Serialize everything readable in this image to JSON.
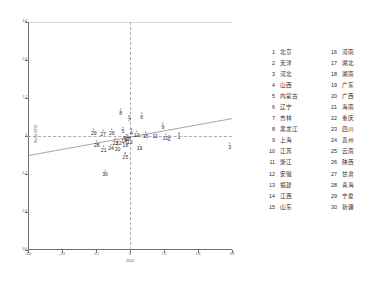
{
  "chart_data": {
    "type": "scatter",
    "title": "",
    "xlabel": "2010",
    "ylabel": "Resid 2010",
    "xlim": [
      -3.6,
      3.6
    ],
    "ylim": [
      -3.6,
      3.6
    ],
    "xticks": [
      "-3.6",
      "-2.4",
      "-1.2",
      "0",
      "1.2",
      "2.4",
      "3.6"
    ],
    "yticks": [
      "-3.6",
      "-2.4",
      "-1.2",
      "0",
      "1.2",
      "2.4",
      "3.6"
    ],
    "grid": false,
    "legend_position": "right",
    "reference_lines": {
      "vertical_x": 0,
      "horizontal_y": 0,
      "style": "dashed"
    },
    "fit_line": {
      "style": "solid",
      "x0": -3.6,
      "y0": -0.62,
      "x1": 3.6,
      "y1": 0.55
    },
    "point_label_field": "id",
    "points": [
      {
        "id": 1,
        "label": "1",
        "x": 1.73,
        "y": 0.08
      },
      {
        "id": 2,
        "label": "2",
        "x": 1.38,
        "y": 0.01
      },
      {
        "id": 3,
        "label": "3",
        "x": 3.52,
        "y": -0.22
      },
      {
        "id": 4,
        "label": "4",
        "x": 0.05,
        "y": 0.22
      },
      {
        "id": 5,
        "label": "5",
        "x": -0.25,
        "y": 0.26
      },
      {
        "id": 6,
        "label": "6",
        "x": 0.41,
        "y": 0.72
      },
      {
        "id": 7,
        "label": "7",
        "x": -0.03,
        "y": 0.63
      },
      {
        "id": 8,
        "label": "8",
        "x": -0.33,
        "y": 0.85
      },
      {
        "id": 9,
        "label": "9",
        "x": 1.16,
        "y": 0.4
      },
      {
        "id": 10,
        "label": "10",
        "x": 1.26,
        "y": 0.06
      },
      {
        "id": 11,
        "label": "11",
        "x": 0.89,
        "y": 0.1
      },
      {
        "id": 12,
        "label": "12",
        "x": 0.23,
        "y": 0.15
      },
      {
        "id": 13,
        "label": "13",
        "x": -0.01,
        "y": -0.09
      },
      {
        "id": 14,
        "label": "14",
        "x": -0.21,
        "y": -0.04
      },
      {
        "id": 15,
        "label": "15",
        "x": 0.55,
        "y": 0.12
      },
      {
        "id": 16,
        "label": "16",
        "x": -0.13,
        "y": 0.04
      },
      {
        "id": 17,
        "label": "17",
        "x": -0.08,
        "y": 0.02
      },
      {
        "id": 18,
        "label": "18",
        "x": -0.16,
        "y": -0.18
      },
      {
        "id": 19,
        "label": "19",
        "x": 0.34,
        "y": -0.28
      },
      {
        "id": 20,
        "label": "20",
        "x": -0.44,
        "y": -0.31
      },
      {
        "id": 21,
        "label": "21",
        "x": -0.93,
        "y": -0.32
      },
      {
        "id": 22,
        "label": "22",
        "x": -0.4,
        "y": -0.12
      },
      {
        "id": 23,
        "label": "23",
        "x": -0.52,
        "y": -0.11
      },
      {
        "id": 24,
        "label": "24",
        "x": -0.67,
        "y": -0.27
      },
      {
        "id": 25,
        "label": "25",
        "x": -0.16,
        "y": -0.55
      },
      {
        "id": 26,
        "label": "26",
        "x": -0.64,
        "y": 0.21
      },
      {
        "id": 27,
        "label": "27",
        "x": -0.95,
        "y": 0.17
      },
      {
        "id": 28,
        "label": "28",
        "x": -1.17,
        "y": -0.17
      },
      {
        "id": 29,
        "label": "29",
        "x": -1.28,
        "y": 0.22
      },
      {
        "id": 30,
        "label": "30",
        "x": -0.88,
        "y": -1.1
      }
    ]
  },
  "legend": {
    "left_column": [
      {
        "num": "1",
        "name": "北京"
      },
      {
        "num": "2",
        "name": "天津"
      },
      {
        "num": "3",
        "name": "河北"
      },
      {
        "num": "4",
        "name": "山西"
      },
      {
        "num": "5",
        "name": "内蒙古"
      },
      {
        "num": "6",
        "name": "辽宁"
      },
      {
        "num": "7",
        "name": "吉林"
      },
      {
        "num": "8",
        "name": "黑龙江"
      },
      {
        "num": "9",
        "name": "上海"
      },
      {
        "num": "10",
        "name": "江苏"
      },
      {
        "num": "11",
        "name": "浙江"
      },
      {
        "num": "12",
        "name": "安徽"
      },
      {
        "num": "13",
        "name": "福建"
      },
      {
        "num": "14",
        "name": "江西"
      },
      {
        "num": "15",
        "name": "山东"
      }
    ],
    "right_column": [
      {
        "num": "16",
        "name": "河南"
      },
      {
        "num": "17",
        "name": "湖北"
      },
      {
        "num": "18",
        "name": "湖南"
      },
      {
        "num": "19",
        "name": "广东"
      },
      {
        "num": "20",
        "name": "广西"
      },
      {
        "num": "21",
        "name": "海南"
      },
      {
        "num": "22",
        "name": "重庆"
      },
      {
        "num": "23",
        "name": "四川"
      },
      {
        "num": "24",
        "name": "贵州"
      },
      {
        "num": "25",
        "name": "云南"
      },
      {
        "num": "26",
        "name": "陕西"
      },
      {
        "num": "27",
        "name": "甘肃"
      },
      {
        "num": "28",
        "name": "青海"
      },
      {
        "num": "29",
        "name": "宁夏"
      },
      {
        "num": "30",
        "name": "新疆"
      }
    ]
  }
}
